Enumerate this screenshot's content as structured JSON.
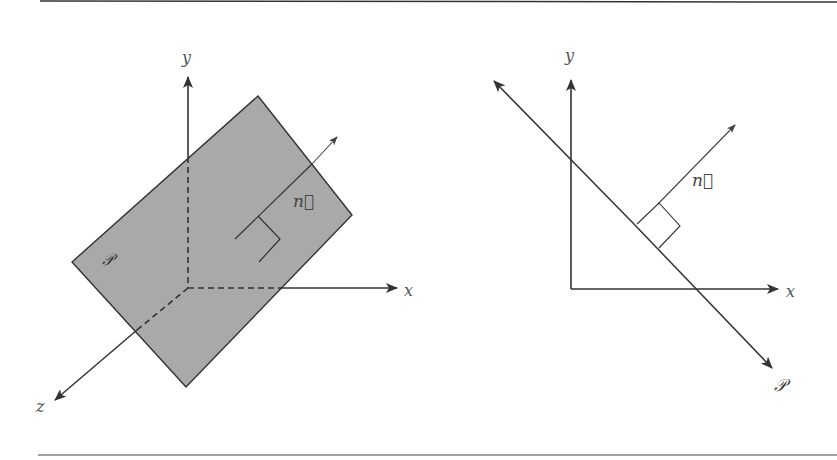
{
  "figure": {
    "left_panel": {
      "axes": {
        "x_label": "x",
        "y_label": "y",
        "z_label": "z"
      },
      "plane_label": "𝒫",
      "normal_label": "n⃗",
      "plane_fill": "#a9a9a9"
    },
    "right_panel": {
      "axes": {
        "x_label": "x",
        "y_label": "y"
      },
      "plane_label": "𝒫",
      "normal_label": "n⃗"
    },
    "line_color": "#333333"
  }
}
